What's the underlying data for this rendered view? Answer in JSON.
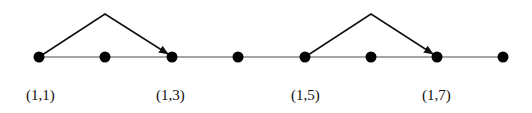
{
  "diagram": {
    "baseline_y": 57,
    "node_color": "#000000",
    "line_color": "#888888",
    "arc_color": "#111111",
    "nodes": [
      {
        "x": 39
      },
      {
        "x": 105
      },
      {
        "x": 172
      },
      {
        "x": 238
      },
      {
        "x": 305
      },
      {
        "x": 371
      },
      {
        "x": 437
      },
      {
        "x": 503
      }
    ],
    "arcs": [
      {
        "from": 0,
        "to": 2,
        "apex_x": 105,
        "apex_y": 14
      },
      {
        "from": 4,
        "to": 6,
        "apex_x": 371,
        "apex_y": 14
      }
    ],
    "labels": [
      {
        "text": "(1,1)",
        "x": 26
      },
      {
        "text": "(1,3)",
        "x": 156
      },
      {
        "text": "(1,5)",
        "x": 291
      },
      {
        "text": "(1,7)",
        "x": 422
      }
    ]
  }
}
